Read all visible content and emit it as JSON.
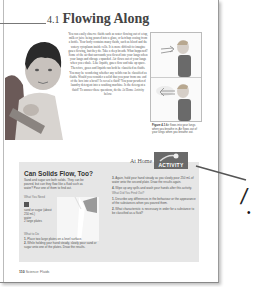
{
  "page": {
    "section_number": "4.1",
    "section_title": "Flowing Along",
    "body_paragraphs": [
      "You can easily observe fluids such as water flowing out of a tap, milk or juice being poured into a glass, or ketchup oozing from a bottle. Your body contains many fluids, such as blood and the watery cytoplasm inside cells. It is more difficult to imagine gases flowing, but they do. Take a deep breath. What happened? Some of the air that surrounds you flowed into your lungs when your lungs and ribcage expanded. Air flows out of your lungs when you exhale. Like liquids, gases flow and take up space. Therefore, gases and liquids can both be classified as fluids.",
      "You may be wondering whether any solids can be classified as fluids. Would you consider a solid that you pour from one end of the box into a bowl? Is cereal a fluid? You pour powdered laundry detergent into a washing machine. Is the detergent a fluid? To answer these questions, do the At Home Activity below."
    ],
    "figure": {
      "caption_label": "Figure 4.1",
      "caption_text": "Air flows into your lungs when you breathe in. Air flows out of your lungs when you breathe out."
    },
    "footer": {
      "page_number": "110",
      "running_title": "Science: Fluids"
    }
  },
  "activity": {
    "at_home_label": "At Home",
    "badge_label": "ACTIVITY",
    "title": "Can Solids Flow, Too?",
    "intro": "Sand and sugar are both solids. They can be poured, but can they flow like a fluid such as water? Pour one of them to find out.",
    "what_you_need_heading": "What You Need",
    "materials": [
      "sand or sugar (about 250 mL)",
      "water",
      "2 large plates"
    ],
    "what_to_do_heading": "What to Do",
    "steps": [
      {
        "num": "1.",
        "text": "Place two large plates on a level surface."
      },
      {
        "num": "2.",
        "text": "While holding your hand steady, slowly pour sand or sugar onto one of the plates. Draw the results."
      },
      {
        "num": "3.",
        "text": "Again, hold your hand steady as you slowly pour 250 mL of water onto the second plate. Draw the results again."
      },
      {
        "num": "4.",
        "text": "Wipe up any spills and wash your hands after this activity."
      }
    ],
    "what_did_you_find_out_heading": "What Did You Find Out?",
    "questions": [
      {
        "num": "1.",
        "text": "Describe any differences in the behaviour or the appearance of the substances when you poured them."
      },
      {
        "num": "2.",
        "text": "What characteristic is necessary in order for a substance to be classified as a fluid?"
      }
    ]
  },
  "annotation": {
    "slash_glyph": "/",
    "bullet_glyph": "•"
  },
  "colors": {
    "activity_background": "#e6e6e6",
    "badge_background": "#6a6a6a",
    "page_border": "#999999"
  }
}
